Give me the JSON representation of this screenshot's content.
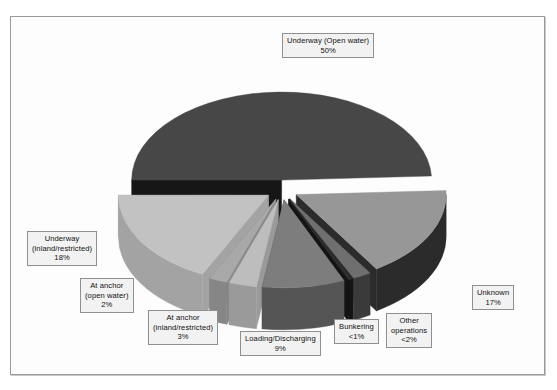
{
  "chart_data": {
    "type": "pie",
    "title": "",
    "subtitle": "",
    "xlabel": "",
    "ylabel": "",
    "legend_position": "none",
    "grid": false,
    "exploded": true,
    "three_d": true,
    "categories": [
      "Underway (Open water)",
      "Unknown",
      "Other operations",
      "Bunkering",
      "Loading/Discharging",
      "At anchor (inland/restricted)",
      "At anchor (open water)",
      "Underway (inland/restricted)"
    ],
    "values": [
      50,
      17,
      2,
      0.5,
      9,
      3,
      2,
      18
    ],
    "value_labels": [
      "50%",
      "17%",
      "<2%",
      "<1%",
      "9%",
      "3%",
      "2%",
      "18%"
    ],
    "slices": [
      {
        "name": "Underway (Open water)",
        "label_line1": "Underway (Open water)",
        "label_line2": "",
        "value_label": "50%",
        "value": 50,
        "top_color": "#474747",
        "side_color": "#161616",
        "label_left": 282,
        "label_top": 33
      },
      {
        "name": "Unknown",
        "label_line1": "Unknown",
        "label_line2": "",
        "value_label": "17%",
        "value": 17,
        "top_color": "#979797",
        "side_color": "#2b2b2b",
        "label_left": 472,
        "label_top": 285
      },
      {
        "name": "Other operations",
        "label_line1": "Other",
        "label_line2": "operations",
        "value_label": "<2%",
        "value": 2,
        "top_color": "#6f6f6f",
        "side_color": "#3a3a3a",
        "label_left": 386,
        "label_top": 313
      },
      {
        "name": "Bunkering",
        "label_line1": "Bunkering",
        "label_line2": "",
        "value_label": "<1%",
        "value": 0.5,
        "top_color": "#2e2e2e",
        "side_color": "#141414",
        "label_left": 334,
        "label_top": 319
      },
      {
        "name": "Loading/Discharging",
        "label_line1": "Loading/Discharging",
        "label_line2": "",
        "value_label": "9%",
        "value": 9,
        "top_color": "#7d7d7d",
        "side_color": "#555555",
        "label_left": 240,
        "label_top": 331
      },
      {
        "name": "At anchor (inland/restricted)",
        "label_line1": "At anchor",
        "label_line2": "(inland/restricted)",
        "value_label": "3%",
        "value": 3,
        "top_color": "#bdbdbd",
        "side_color": "#9a9a9a",
        "label_left": 148,
        "label_top": 310
      },
      {
        "name": "At anchor (open water)",
        "label_line1": "At anchor",
        "label_line2": "(open water)",
        "value_label": "2%",
        "value": 2,
        "top_color": "#a8a8a8",
        "side_color": "#868686",
        "label_left": 80,
        "label_top": 278
      },
      {
        "name": "Underway (inland/restricted)",
        "label_line1": "Underway",
        "label_line2": "(inland/restricted)",
        "value_label": "18%",
        "value": 18,
        "top_color": "#c2c2c2",
        "side_color": "#a3a3a3",
        "label_left": 27,
        "label_top": 231
      }
    ]
  },
  "colors": {
    "frame_border": "#9a9a9a",
    "plot_background": "#fdfdfd",
    "label_background": "#f2f2f2",
    "label_border": "#8f8f8f",
    "label_text": "#111111"
  }
}
